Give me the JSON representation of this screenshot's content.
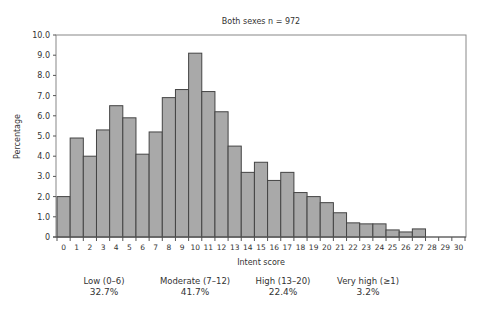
{
  "chart_data": {
    "type": "bar",
    "title": "Both sexes n = 972",
    "xlabel": "Intent score",
    "ylabel": "Percentage",
    "ylim": [
      0,
      10
    ],
    "yticks": [
      "0",
      "1.0",
      "2.0",
      "3.0",
      "4.0",
      "5.0",
      "6.0",
      "7.0",
      "8.0",
      "9.0",
      "10.0"
    ],
    "categories": [
      "0",
      "1",
      "2",
      "3",
      "4",
      "5",
      "6",
      "7",
      "8",
      "9",
      "10",
      "11",
      "12",
      "13",
      "14",
      "15",
      "16",
      "17",
      "18",
      "19",
      "20",
      "21",
      "22",
      "23",
      "24",
      "25",
      "26",
      "27",
      "28",
      "29",
      "30"
    ],
    "values": [
      2.0,
      4.9,
      4.0,
      5.3,
      6.5,
      5.9,
      4.1,
      5.2,
      6.9,
      7.3,
      9.1,
      7.2,
      6.2,
      4.5,
      3.2,
      3.7,
      2.8,
      3.2,
      2.2,
      2.0,
      1.7,
      1.2,
      0.7,
      0.65,
      0.65,
      0.35,
      0.25,
      0.4,
      0,
      0,
      0
    ],
    "grid": false,
    "bar_color": "#a9a9a9",
    "annotations": [
      {
        "label": "Low (0–6)",
        "value": "32.7%"
      },
      {
        "label": "Moderate (7–12)",
        "value": "41.7%"
      },
      {
        "label": "High (13–20)",
        "value": "22.4%"
      },
      {
        "label": "Very high (≥1)",
        "value": "3.2%"
      }
    ]
  }
}
